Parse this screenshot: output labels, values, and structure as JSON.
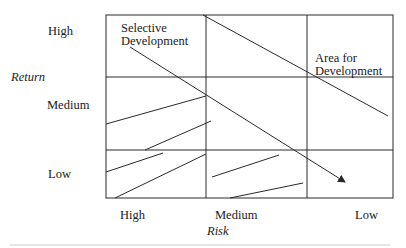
{
  "diagram": {
    "type": "portfolio-matrix",
    "y_axis": {
      "title": "Return",
      "levels": [
        "High",
        "Medium",
        "Low"
      ]
    },
    "x_axis": {
      "title": "Risk",
      "levels": [
        "High",
        "Medium",
        "Low"
      ]
    },
    "regions": {
      "selective_development": {
        "line1": "Selective",
        "line2": "Development"
      },
      "area_for_development": {
        "line1": "Area for",
        "line2": "Development"
      }
    },
    "colors": {
      "line": "#2a2a2a",
      "text": "#1a1a1a",
      "background": "#ffffff"
    }
  }
}
